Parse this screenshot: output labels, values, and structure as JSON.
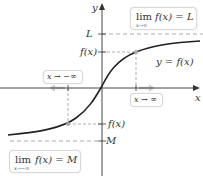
{
  "axes": {
    "x_label": "x",
    "y_label": "y"
  },
  "labels": {
    "L": "L",
    "M": "M",
    "fx_upper": "f(x)",
    "fx_lower": "f(x)",
    "curve": "y = f(x)"
  },
  "boxes": {
    "upper_limit": {
      "lim": "lim",
      "sub": "x→∞",
      "expr": "f(x) = L"
    },
    "lower_limit": {
      "lim": "lim",
      "sub": "x→−∞",
      "expr": "f(x) = M"
    },
    "x_pos_inf": "x → ∞",
    "x_neg_inf": "x → −∞"
  },
  "colors": {
    "curve": "#222222",
    "axis": "#333333",
    "dash": "#9a9a9a",
    "arrow_hint": "#c8c8c8",
    "point": "#a8a8a8"
  }
}
